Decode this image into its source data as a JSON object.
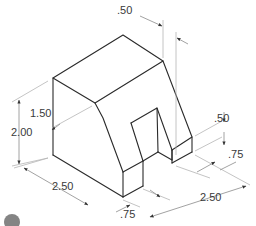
{
  "figure": {
    "type": "isometric-technical-drawing",
    "line_color": "#2a2a2a",
    "dimension_color": "#8a8a8a"
  },
  "dimensions": {
    "top_offset": ".50",
    "height_upper": "1.50",
    "height_total": "2.00",
    "depth_left": "2.50",
    "notch_width": ".75",
    "notch_height": ".50",
    "right_step": ".75",
    "width_right": "2.50"
  }
}
